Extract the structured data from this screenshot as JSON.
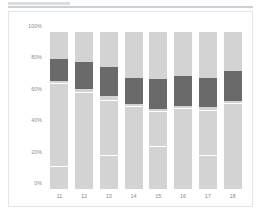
{
  "top_rules": {
    "short_label": "",
    "long_label": ""
  },
  "chart_data": {
    "type": "bar",
    "subtype": "stacked-percent",
    "title": "",
    "subtitle": "",
    "xlabel": "",
    "ylabel": "",
    "grid": false,
    "legend": "none",
    "ylim": [
      0,
      100
    ],
    "yticks": [
      "0%",
      "20%",
      "40%",
      "60%",
      "80%",
      "100%"
    ],
    "ytick_values": [
      0,
      20,
      40,
      60,
      80,
      100
    ],
    "categories": [
      "11",
      "12",
      "13",
      "14",
      "15",
      "16",
      "17",
      "18"
    ],
    "colors": {
      "light": "#d3d3d3",
      "dark": "#6a6a6a",
      "divider": "#ffffff",
      "panel_border": "#e2e5e8",
      "tick_text": "#8a8a8a",
      "background": "#ffffff"
    },
    "series": [
      {
        "name": "lower",
        "values": [
          69,
          64,
          59,
          54,
          51,
          53,
          52,
          56
        ]
      },
      {
        "name": "highlight",
        "values": [
          14,
          17,
          19,
          17,
          19,
          19,
          19,
          19
        ]
      },
      {
        "name": "upper",
        "values": [
          17,
          19,
          22,
          29,
          30,
          28,
          29,
          25
        ]
      }
    ],
    "bars": [
      {
        "category": "11",
        "dark_start": 69,
        "dark_end": 83,
        "dividers": [
          14,
          67
        ]
      },
      {
        "category": "12",
        "dark_start": 64,
        "dark_end": 81,
        "dividers": [
          61
        ]
      },
      {
        "category": "13",
        "dark_start": 59,
        "dark_end": 78,
        "dividers": [
          21,
          56
        ]
      },
      {
        "category": "14",
        "dark_start": 54,
        "dark_end": 71,
        "dividers": [
          52
        ]
      },
      {
        "category": "15",
        "dark_start": 51,
        "dark_end": 70,
        "dividers": [
          27,
          49
        ]
      },
      {
        "category": "16",
        "dark_start": 53,
        "dark_end": 72,
        "dividers": [
          51
        ]
      },
      {
        "category": "17",
        "dark_start": 52,
        "dark_end": 71,
        "dividers": [
          21,
          50
        ]
      },
      {
        "category": "18",
        "dark_start": 56,
        "dark_end": 75,
        "dividers": [
          54
        ]
      }
    ]
  }
}
